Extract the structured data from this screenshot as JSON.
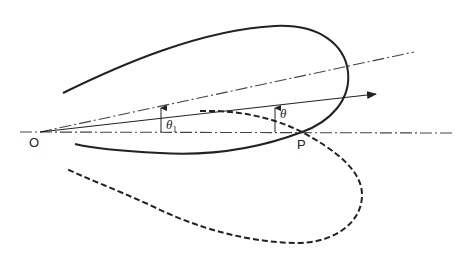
{
  "diagram": {
    "type": "polar-loop-diagram",
    "labels": {
      "origin": "O",
      "intersection": "P",
      "theta1": "θ",
      "theta1_sub": "1",
      "theta": "θ"
    },
    "elements": [
      {
        "name": "reference-axis",
        "style": "dash-dot",
        "from": "O",
        "to": "right"
      },
      {
        "name": "inclined-axis",
        "style": "dash-dot",
        "from": "O",
        "angle_label": "θ1"
      },
      {
        "name": "direction-arrow",
        "style": "solid-arrow",
        "from": "O",
        "angle_label_relative_to_axis": "θ"
      },
      {
        "name": "solid-loop",
        "style": "solid",
        "passes_through": "P"
      },
      {
        "name": "dashed-loop",
        "style": "dashed",
        "passes_through": "P"
      }
    ],
    "colors": {
      "stroke": "#222222",
      "axis": "#333333",
      "background": "#ffffff"
    }
  }
}
